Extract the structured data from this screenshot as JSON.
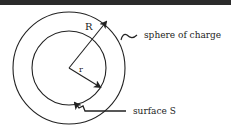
{
  "diagram": {
    "labels": {
      "outer_radius": "R",
      "inner_radius": "r",
      "sphere": "sphere of charge",
      "surface": "surface S"
    },
    "colors": {
      "stroke": "#222222",
      "background": "#ffffff",
      "top_bar": "#2b2b2b"
    }
  }
}
